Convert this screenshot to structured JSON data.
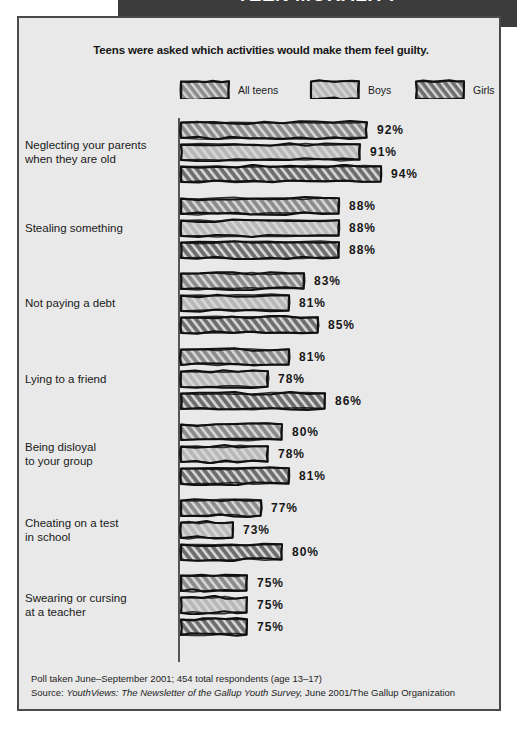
{
  "banner": {
    "title": "TEEN MORALITY"
  },
  "chart_title": "Teens were asked which activities would make them feel guilty.",
  "legend": [
    {
      "label": "All teens",
      "color": "#8c8c8c",
      "swatch": "legend-swatch-all-teens"
    },
    {
      "label": "Boys",
      "color": "#b8b8b8",
      "swatch": "legend-swatch-boys"
    },
    {
      "label": "Girls",
      "color": "#6e6e6e",
      "swatch": "legend-swatch-girls"
    }
  ],
  "footnote": {
    "line1": "Poll taken June–September 2001; 454 total respondents (age 13–17)",
    "line2_prefix": "Source: ",
    "line2_italic": "YouthViews: The Newsletter of the Gallup Youth Survey,",
    "line2_suffix": " June 2001/The Gallup Organization"
  },
  "chart_data": {
    "type": "bar",
    "title": "Teens were asked which activities would make them feel guilty.",
    "xlabel": "",
    "ylabel": "",
    "orientation": "horizontal",
    "grid": false,
    "legend_position": "top",
    "value_suffix": "%",
    "xlim": [
      65,
      100
    ],
    "categories": [
      "Neglecting your parents when they are old",
      "Stealing something",
      "Not paying a debt",
      "Lying to a friend",
      "Being disloyal to your group",
      "Cheating on a test in school",
      "Swearing or cursing at a teacher"
    ],
    "category_lines": [
      [
        "Neglecting your parents",
        "when they are old"
      ],
      [
        "Stealing something"
      ],
      [
        "Not paying a debt"
      ],
      [
        "Lying to a friend"
      ],
      [
        "Being disloyal",
        "to your group"
      ],
      [
        "Cheating on a test",
        "in school"
      ],
      [
        "Swearing or cursing",
        "at a teacher"
      ]
    ],
    "series": [
      {
        "name": "All teens",
        "color": "#8c8c8c",
        "values": [
          92,
          88,
          83,
          81,
          80,
          77,
          75
        ]
      },
      {
        "name": "Boys",
        "color": "#b8b8b8",
        "values": [
          91,
          88,
          81,
          78,
          78,
          73,
          75
        ]
      },
      {
        "name": "Girls",
        "color": "#6e6e6e",
        "values": [
          94,
          88,
          85,
          86,
          81,
          80,
          75
        ]
      }
    ],
    "labels": [
      [
        "92%",
        "91%",
        "94%"
      ],
      [
        "88%",
        "88%",
        "88%"
      ],
      [
        "83%",
        "81%",
        "85%"
      ],
      [
        "81%",
        "78%",
        "86%"
      ],
      [
        "80%",
        "78%",
        "81%"
      ],
      [
        "77%",
        "73%",
        "80%"
      ],
      [
        "75%",
        "75%",
        "75%"
      ]
    ]
  }
}
